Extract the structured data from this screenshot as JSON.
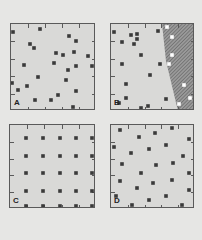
{
  "figure": {
    "background": "#e6e6e4",
    "panel_fill": "#d9d9d7",
    "border_color": "#5a5a5a",
    "dot_color": "#3a3a3a",
    "open_dot_color": "#ffffff",
    "hatch_color": "#6a6a6a"
  },
  "panels": [
    {
      "id": "A",
      "label": "A",
      "box": {
        "x": 10,
        "y": 23,
        "w": 85,
        "h": 87
      },
      "pattern": "random",
      "dots": [
        [
          12,
          31
        ],
        [
          39,
          28
        ],
        [
          68,
          35
        ],
        [
          75,
          40
        ],
        [
          29,
          43
        ],
        [
          33,
          47
        ],
        [
          55,
          52
        ],
        [
          62,
          54
        ],
        [
          73,
          51
        ],
        [
          87,
          55
        ],
        [
          91,
          65
        ],
        [
          53,
          62
        ],
        [
          75,
          65
        ],
        [
          23,
          64
        ],
        [
          67,
          69
        ],
        [
          37,
          76
        ],
        [
          65,
          79
        ],
        [
          11,
          82
        ],
        [
          26,
          85
        ],
        [
          17,
          89
        ],
        [
          75,
          90
        ],
        [
          57,
          94
        ],
        [
          34,
          99
        ],
        [
          50,
          99
        ],
        [
          72,
          106
        ]
      ]
    },
    {
      "id": "B",
      "label": "B",
      "box": {
        "x": 110,
        "y": 23,
        "w": 84,
        "h": 87
      },
      "pattern": "random-with-hatched-region",
      "dots": [
        [
          113,
          31
        ],
        [
          130,
          34
        ],
        [
          136,
          33
        ],
        [
          136,
          38
        ],
        [
          157,
          30
        ],
        [
          121,
          41
        ],
        [
          133,
          43
        ],
        [
          140,
          54
        ],
        [
          121,
          63
        ],
        [
          159,
          63
        ],
        [
          149,
          74
        ],
        [
          125,
          83
        ],
        [
          125,
          97
        ],
        [
          118,
          102
        ],
        [
          165,
          98
        ],
        [
          140,
          107
        ],
        [
          147,
          105
        ]
      ],
      "open_dots": [
        [
          166,
          26
        ],
        [
          171,
          36
        ],
        [
          171,
          54
        ],
        [
          168,
          63
        ],
        [
          183,
          84
        ],
        [
          189,
          97
        ],
        [
          178,
          103
        ]
      ],
      "hatched_region": [
        [
          161,
          23
        ],
        [
          165,
          60
        ],
        [
          177,
          110
        ],
        [
          194,
          110
        ],
        [
          194,
          23
        ]
      ]
    },
    {
      "id": "C",
      "label": "C",
      "box": {
        "x": 9,
        "y": 124,
        "w": 86,
        "h": 84
      },
      "pattern": "regular",
      "grid_x": [
        25,
        42,
        59,
        75,
        91
      ],
      "grid_y": [
        137,
        155,
        172,
        190,
        205
      ]
    },
    {
      "id": "D",
      "label": "D",
      "box": {
        "x": 110,
        "y": 124,
        "w": 84,
        "h": 84
      },
      "pattern": "uniform",
      "dots": [
        [
          119,
          129
        ],
        [
          138,
          136
        ],
        [
          154,
          132
        ],
        [
          171,
          127
        ],
        [
          188,
          138
        ],
        [
          113,
          146
        ],
        [
          148,
          148
        ],
        [
          165,
          144
        ],
        [
          130,
          152
        ],
        [
          182,
          155
        ],
        [
          121,
          163
        ],
        [
          155,
          164
        ],
        [
          172,
          162
        ],
        [
          140,
          172
        ],
        [
          188,
          172
        ],
        [
          119,
          180
        ],
        [
          152,
          182
        ],
        [
          171,
          179
        ],
        [
          136,
          187
        ],
        [
          188,
          189
        ],
        [
          115,
          195
        ],
        [
          165,
          195
        ],
        [
          148,
          199
        ],
        [
          131,
          204
        ],
        [
          181,
          204
        ]
      ]
    }
  ]
}
